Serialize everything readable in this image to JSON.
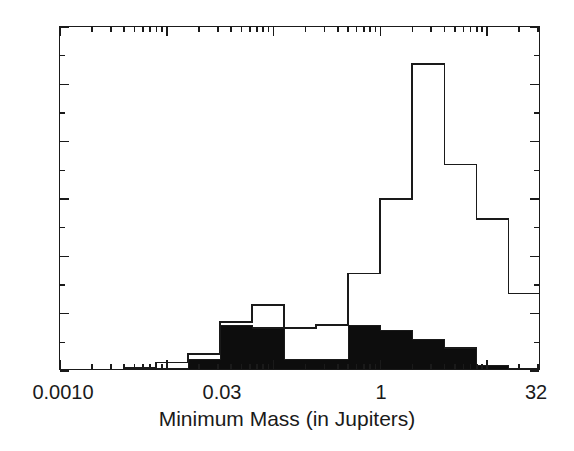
{
  "figure": {
    "background": "#ffffff",
    "ink": "#1a1a1a"
  },
  "axis": {
    "x_title": "Minimum Mass (in Jupiters)",
    "y_title": "",
    "x_tick_labels": [
      "0.0010",
      "0.03",
      "1",
      "32"
    ],
    "y_tick_labels": [
      "0",
      "20",
      "40",
      "60",
      "80",
      "100",
      "120"
    ]
  },
  "chart_data": {
    "type": "bar",
    "title": "",
    "subtitle": "",
    "xlabel": "Minimum Mass (in Jupiters)",
    "ylabel": "",
    "xscale": "log",
    "yscale": "linear",
    "xlim": [
      0.001,
      32.0
    ],
    "ylim": [
      0,
      120
    ],
    "grid": false,
    "legend": "none",
    "x_tick_values": [
      0.001,
      0.03,
      1,
      32
    ],
    "x_tick_labels": [
      "0.0010",
      "0.03",
      "1",
      "32"
    ],
    "y_ticks_major": [
      0,
      20,
      40,
      60,
      80,
      100,
      120
    ],
    "y_ticks_minor_step": 10,
    "bin_edges_log10": [
      -3.0,
      -2.7,
      -2.4,
      -2.1,
      -1.8,
      -1.5,
      -1.2,
      -0.9,
      -0.6,
      -0.3,
      0.0,
      0.3,
      0.6,
      0.9,
      1.2,
      1.5
    ],
    "bin_count": 15,
    "series": [
      {
        "name": "All planets (open outline)",
        "style": "outline",
        "color": "#1a1a1a",
        "fill": "none",
        "values": [
          0,
          0,
          1,
          3,
          6,
          17,
          23,
          15,
          16,
          34,
          60,
          107,
          72,
          53,
          27
        ]
      },
      {
        "name": "Subset (filled black)",
        "style": "filled",
        "color": "#1a1a1a",
        "fill": "#0d0d0d",
        "values": [
          0,
          0,
          1,
          1,
          4,
          16,
          15,
          4,
          4,
          16,
          14,
          11,
          8,
          2,
          1
        ]
      }
    ],
    "annotations": []
  }
}
